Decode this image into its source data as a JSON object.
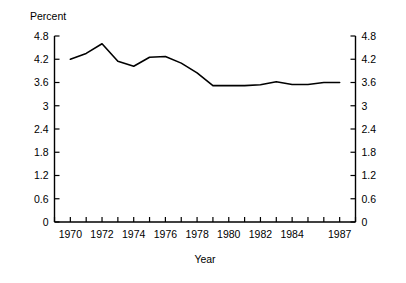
{
  "chart_data": {
    "type": "line",
    "title": "",
    "ylabel": "Percent",
    "xlabel": "Year",
    "ylim": [
      0,
      4.8
    ],
    "xlim": [
      1969,
      1988
    ],
    "grid": false,
    "legend": null,
    "y_ticks": [
      "4.8",
      "4.2",
      "3.6",
      "3",
      "2.4",
      "1.8",
      "1.2",
      "0.6",
      "0"
    ],
    "y_tick_values": [
      4.8,
      4.2,
      3.6,
      3.0,
      2.4,
      1.8,
      1.2,
      0.6,
      0
    ],
    "x_tick_labels": [
      "1970",
      "1972",
      "1974",
      "1976",
      "1978",
      "1980",
      "1982",
      "1984",
      "1987"
    ],
    "x_tick_values": [
      1970,
      1972,
      1974,
      1976,
      1978,
      1980,
      1982,
      1984,
      1987
    ],
    "x_minor_ticks": [
      1969,
      1970,
      1971,
      1972,
      1973,
      1974,
      1975,
      1976,
      1977,
      1978,
      1979,
      1980,
      1981,
      1982,
      1983,
      1984,
      1985,
      1986,
      1987,
      1988
    ],
    "axes": "left-and-right-mirrored",
    "x": [
      1970,
      1971,
      1972,
      1973,
      1974,
      1975,
      1976,
      1977,
      1978,
      1979,
      1980,
      1981,
      1982,
      1983,
      1984,
      1985,
      1986,
      1987
    ],
    "values": [
      4.2,
      4.35,
      4.6,
      4.15,
      4.02,
      4.25,
      4.27,
      4.1,
      3.85,
      3.52,
      3.52,
      3.52,
      3.54,
      3.62,
      3.55,
      3.55,
      3.6,
      3.6
    ],
    "series": [
      {
        "name": "Percent",
        "values": [
          4.2,
          4.35,
          4.6,
          4.15,
          4.02,
          4.25,
          4.27,
          4.1,
          3.85,
          3.52,
          3.52,
          3.52,
          3.54,
          3.62,
          3.55,
          3.55,
          3.6,
          3.6
        ]
      }
    ]
  },
  "labels": {
    "y_axis_title": "Percent",
    "x_axis_title": "Year"
  },
  "colors": {
    "line": "#000000",
    "axis": "#000000",
    "background": "#ffffff"
  }
}
